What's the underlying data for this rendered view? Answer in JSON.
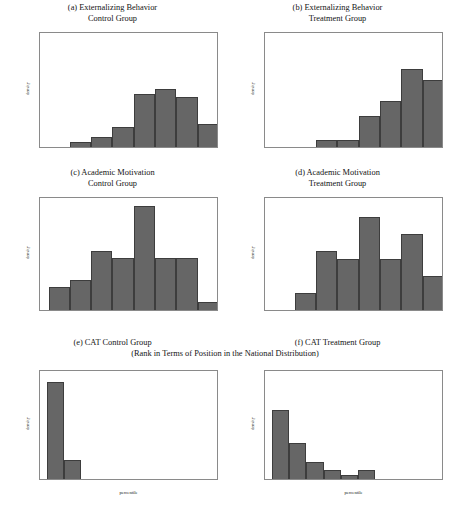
{
  "figure": {
    "bar_color": "#666666",
    "bar_edge_color": "#3d3d3d",
    "axis_color": "#8a8a8a",
    "background": "#ffffff",
    "shared_subtitle": "(Rank in Terms of Position in the National Distribution)"
  },
  "chart_data": [
    {
      "id": "panel-a",
      "type": "bar",
      "title": "(a) Externalizing Behavior",
      "title_line2": "Control Group",
      "xlabel": "",
      "ylabel": "density",
      "xlim": [
        0.8,
        5.0
      ],
      "ylim": [
        0,
        1
      ],
      "xticks": [
        1,
        2,
        3,
        4,
        5
      ],
      "xticklabels": [
        "1",
        "2",
        "3",
        "4",
        "5"
      ],
      "yticks": [
        0,
        0.2,
        0.4,
        0.6,
        0.8,
        1
      ],
      "yticklabels": [
        "0",
        ".2",
        ".4",
        ".6",
        ".8",
        "1"
      ],
      "bin_edges": [
        1.5,
        2.0,
        2.5,
        3.0,
        3.5,
        4.0,
        4.5,
        5.0
      ],
      "values": [
        0.04,
        0.09,
        0.17,
        0.46,
        0.5,
        0.43,
        0.2
      ],
      "grid": false,
      "legend": "none"
    },
    {
      "id": "panel-b",
      "type": "bar",
      "title": "(b) Externalizing Behavior",
      "title_line2": "Treatment Group",
      "xlabel": "",
      "ylabel": "density",
      "xlim": [
        0.8,
        5.0
      ],
      "ylim": [
        0,
        1
      ],
      "xticks": [
        1,
        2,
        3,
        4,
        5
      ],
      "xticklabels": [
        "1",
        "2",
        "3",
        "4",
        "5"
      ],
      "yticks": [
        0,
        0.2,
        0.4,
        0.6,
        0.8,
        1
      ],
      "yticklabels": [
        "0",
        ".2",
        ".4",
        ".6",
        ".8",
        "1"
      ],
      "bin_edges": [
        2.0,
        2.5,
        3.0,
        3.5,
        4.0,
        4.5,
        5.0
      ],
      "values": [
        0.06,
        0.06,
        0.27,
        0.4,
        0.67,
        0.58
      ],
      "grid": false,
      "legend": "none"
    },
    {
      "id": "panel-c",
      "type": "bar",
      "title": "(c) Academic Motivation",
      "title_line2": "Control Group",
      "xlabel": "",
      "ylabel": "density",
      "xlim": [
        0.8,
        5.0
      ],
      "ylim": [
        0,
        0.6
      ],
      "xticks": [
        1,
        2,
        3,
        4,
        5
      ],
      "xticklabels": [
        "1",
        "2",
        "3",
        "4",
        "5"
      ],
      "yticks": [
        0,
        0.1,
        0.2,
        0.3,
        0.4,
        0.5,
        0.6
      ],
      "yticklabels": [
        "0",
        ".1",
        ".2",
        ".3",
        ".4",
        ".5",
        ".6"
      ],
      "bin_edges": [
        1.0,
        1.5,
        2.0,
        2.5,
        3.0,
        3.5,
        4.0,
        4.5,
        5.0
      ],
      "values": [
        0.12,
        0.16,
        0.31,
        0.275,
        0.55,
        0.275,
        0.275,
        0.04
      ],
      "grid": false,
      "legend": "none"
    },
    {
      "id": "panel-d",
      "type": "bar",
      "title": "(d) Academic Motivation",
      "title_line2": "Treatment Group",
      "xlabel": "",
      "ylabel": "density",
      "xlim": [
        0.8,
        5.0
      ],
      "ylim": [
        0,
        0.6
      ],
      "xticks": [
        1,
        2,
        3,
        4,
        5
      ],
      "xticklabels": [
        "1",
        "2",
        "3",
        "4",
        "5"
      ],
      "yticks": [
        0,
        0.1,
        0.2,
        0.3,
        0.4,
        0.5,
        0.6
      ],
      "yticklabels": [
        "0",
        ".1",
        ".2",
        ".3",
        ".4",
        ".5",
        ".6"
      ],
      "bin_edges": [
        1.5,
        2.0,
        2.5,
        3.0,
        3.5,
        4.0,
        4.5,
        5.0
      ],
      "values": [
        0.09,
        0.31,
        0.27,
        0.49,
        0.27,
        0.4,
        0.18
      ],
      "grid": false,
      "legend": "none"
    },
    {
      "id": "panel-e",
      "type": "bar",
      "title": "(e) CAT Control Group",
      "title_line2": "",
      "xlabel": "percentile",
      "ylabel": "density",
      "xlim": [
        -4,
        100
      ],
      "ylim": [
        0,
        0.08
      ],
      "xticks": [
        0,
        20,
        40,
        60,
        80,
        100
      ],
      "xticklabels": [
        "0",
        "20",
        "40",
        "60",
        "80",
        "100"
      ],
      "yticks": [
        0,
        0.02,
        0.04,
        0.06,
        0.08
      ],
      "yticklabels": [
        "0",
        ".02",
        ".04",
        ".06",
        ".08"
      ],
      "bin_edges": [
        0,
        10,
        20
      ],
      "values": [
        0.0705,
        0.0135
      ],
      "grid": false,
      "legend": "none"
    },
    {
      "id": "panel-f",
      "type": "bar",
      "title": "(f) CAT Treatment Group",
      "title_line2": "",
      "xlabel": "percentile",
      "ylabel": "density",
      "xlim": [
        -4,
        100
      ],
      "ylim": [
        0,
        0.08
      ],
      "xticks": [
        0,
        20,
        40,
        60,
        80,
        100
      ],
      "xticklabels": [
        "0",
        "20",
        "40",
        "60",
        "80",
        "100"
      ],
      "yticks": [
        0,
        0.02,
        0.04,
        0.06,
        0.08
      ],
      "yticklabels": [
        "0",
        ".02",
        ".04",
        ".06",
        ".08"
      ],
      "bin_edges": [
        0,
        10,
        20,
        30,
        40,
        50,
        60
      ],
      "values": [
        0.0505,
        0.0265,
        0.0122,
        0.0062,
        0.0032,
        0.0062
      ],
      "grid": false,
      "legend": "none"
    }
  ]
}
